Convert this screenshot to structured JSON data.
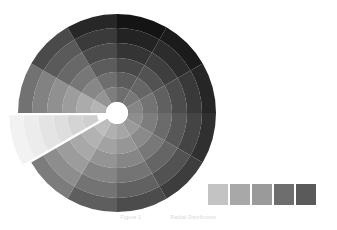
{
  "figure": {
    "background_color": "#ffffff",
    "width": 337,
    "height": 230
  },
  "caption": {
    "left_text": "Figure 1",
    "right_text": "Radial Distribution"
  },
  "legend": {
    "position": "bottom-right",
    "orientation": "horizontal",
    "swatch_count": 5,
    "items": [
      {
        "label": "Ring 1",
        "color": "#c3c3c3"
      },
      {
        "label": "Ring 2",
        "color": "#a8a8a8"
      },
      {
        "label": "Ring 3",
        "color": "#9a9a9a"
      },
      {
        "label": "Ring 4",
        "color": "#6e6e6e"
      },
      {
        "label": "Ring 5",
        "color": "#5a5a5a"
      }
    ]
  },
  "chart_data": {
    "type": "pie",
    "subtype": "sunburst-radial-donut",
    "title": "",
    "subtitle": "",
    "xlabel": "",
    "ylabel": "",
    "grid": false,
    "legend_position": "bottom-right",
    "center_x": 117,
    "center_y": 113,
    "inner_radius": 11,
    "outer_radius": 99,
    "ring_count": 6,
    "sector_count": 12,
    "start_angle_deg": -90,
    "exploded_sector_index": 8,
    "explode_offset": 9,
    "ring_labels": [
      "R1",
      "R2",
      "R3",
      "R4",
      "R5",
      "R6"
    ],
    "sector_labels": [
      "S1",
      "S2",
      "S3",
      "S4",
      "S5",
      "S6",
      "S7",
      "S8",
      "S9",
      "S10",
      "S11",
      "S12"
    ],
    "ring_radii": [
      11,
      26,
      41,
      55,
      70,
      85,
      99
    ],
    "series": [
      {
        "name": "R1",
        "values": [
          46,
          40,
          34,
          30,
          26,
          22,
          20,
          16,
          12,
          20,
          30,
          38
        ],
        "colors": [
          "#6e6e6e",
          "#787878",
          "#858585",
          "#8e8e8e",
          "#9a9a9a",
          "#a6a6a6",
          "#b0b0b0",
          "#bdbdbd",
          "#cfcfcf",
          "#b4b4b4",
          "#949494",
          "#7e7e7e"
        ]
      },
      {
        "name": "R2",
        "values": [
          40,
          34,
          28,
          25,
          22,
          19,
          17,
          13,
          9,
          17,
          26,
          33
        ],
        "colors": [
          "#5c5c5c",
          "#666666",
          "#737373",
          "#7d7d7d",
          "#8a8a8a",
          "#969696",
          "#a2a2a2",
          "#b2b2b2",
          "#d4d4d4",
          "#ababab",
          "#878787",
          "#6e6e6e"
        ]
      },
      {
        "name": "R3",
        "values": [
          32,
          27,
          22,
          20,
          18,
          16,
          14,
          11,
          7,
          14,
          21,
          27
        ],
        "colors": [
          "#484848",
          "#525252",
          "#606060",
          "#6b6b6b",
          "#787878",
          "#868686",
          "#949494",
          "#a8a8a8",
          "#dedede",
          "#9d9d9d",
          "#777777",
          "#5c5c5c"
        ]
      },
      {
        "name": "R4",
        "values": [
          24,
          20,
          17,
          15,
          14,
          12,
          11,
          9,
          6,
          11,
          16,
          21
        ],
        "colors": [
          "#343434",
          "#3e3e3e",
          "#4c4c4c",
          "#575757",
          "#656565",
          "#747474",
          "#848484",
          "#9c9c9c",
          "#e4e4e4",
          "#909090",
          "#686868",
          "#4a4a4a"
        ]
      },
      {
        "name": "R5",
        "values": [
          17,
          14,
          12,
          11,
          10,
          9,
          8,
          7,
          5,
          8,
          12,
          15
        ],
        "colors": [
          "#232323",
          "#2c2c2c",
          "#393939",
          "#444444",
          "#525252",
          "#616161",
          "#737373",
          "#8d8d8d",
          "#ececec",
          "#828282",
          "#5a5a5a",
          "#3a3a3a"
        ]
      },
      {
        "name": "R6",
        "values": [
          11,
          9,
          8,
          7,
          7,
          6,
          6,
          5,
          4,
          6,
          8,
          10
        ],
        "colors": [
          "#141414",
          "#1b1b1b",
          "#262626",
          "#303030",
          "#3d3d3d",
          "#4c4c4c",
          "#5e5e5e",
          "#7c7c7c",
          "#f2f2f2",
          "#727272",
          "#4a4a4a",
          "#272727"
        ]
      }
    ]
  }
}
